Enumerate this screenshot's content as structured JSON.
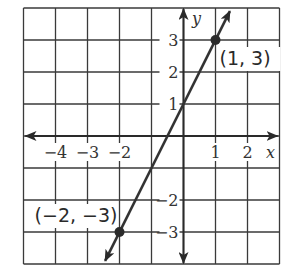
{
  "chart_data": {
    "type": "line",
    "title": "",
    "xlabel": "x",
    "ylabel": "y",
    "xlim": [
      -5,
      3
    ],
    "ylim": [
      -4,
      4
    ],
    "grid": true,
    "x_tick_labels": [
      {
        "value": -4,
        "label": "−4"
      },
      {
        "value": -3,
        "label": "−3"
      },
      {
        "value": -2,
        "label": "−2"
      },
      {
        "value": 1,
        "label": "1"
      },
      {
        "value": 2,
        "label": "2"
      }
    ],
    "y_tick_labels": [
      {
        "value": 3,
        "label": "3"
      },
      {
        "value": 2,
        "label": "2"
      },
      {
        "value": 1,
        "label": "1"
      },
      {
        "value": -2,
        "label": "−2"
      },
      {
        "value": -3,
        "label": "−3"
      }
    ],
    "series": [
      {
        "name": "y = 2x + 1",
        "slope": 2,
        "intercept": 1,
        "x": [
          -2.45,
          1.45
        ],
        "y": [
          -3.9,
          3.9
        ],
        "arrows_both_ends": true
      }
    ],
    "points": [
      {
        "x": 1,
        "y": 3,
        "label": "(1, 3)"
      },
      {
        "x": -2,
        "y": -3,
        "label": "(−2, −3)"
      }
    ],
    "colors": {
      "grid": "#3a3a3a",
      "axis": "#2a2a2a",
      "line": "#333333",
      "point": "#2a2a2a",
      "text": "#333333"
    }
  }
}
